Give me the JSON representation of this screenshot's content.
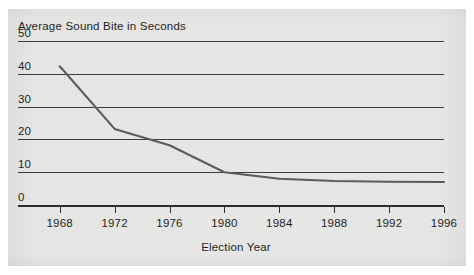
{
  "chart_data": {
    "type": "line",
    "title": "Average Sound Bite in Seconds",
    "xlabel": "Election Year",
    "ylabel": "",
    "x": [
      1968,
      1972,
      1976,
      1980,
      1984,
      1988,
      1992,
      1996
    ],
    "categories": [
      "1968",
      "1972",
      "1976",
      "1980",
      "1984",
      "1988",
      "1992",
      "1996"
    ],
    "values": [
      42.3,
      23.2,
      18.2,
      10.0,
      8.0,
      7.3,
      7.1,
      7.0
    ],
    "series": [
      {
        "name": "Average Sound Bite in Seconds",
        "values": [
          42.3,
          23.2,
          18.2,
          10.0,
          8.0,
          7.3,
          7.1,
          7.0
        ]
      }
    ],
    "xlim": [
      1967,
      1996
    ],
    "ylim": [
      0,
      50
    ],
    "yticks": [
      0,
      10,
      20,
      30,
      40,
      50
    ],
    "ytick_labels": [
      "0",
      "10",
      "20",
      "30",
      "40",
      "50"
    ],
    "xticks": [
      1968,
      1972,
      1976,
      1980,
      1984,
      1988,
      1992,
      1996
    ],
    "xtick_labels": [
      "1968",
      "1972",
      "1976",
      "1980",
      "1984",
      "1988",
      "1992",
      "1996"
    ],
    "grid": true,
    "grid_axis": "y",
    "legend": false,
    "legend_position": "none",
    "line_color": "#5b5b5b",
    "axis_color": "#2b2b2b",
    "grid_color": "#3c3c3c",
    "background_color": "#e7e7e5",
    "page_color": "#ffffff"
  },
  "axis": {
    "y_ticks": [
      {
        "label": "50",
        "value": 50
      },
      {
        "label": "40",
        "value": 40
      },
      {
        "label": "30",
        "value": 30
      },
      {
        "label": "20",
        "value": 20
      },
      {
        "label": "10",
        "value": 10
      },
      {
        "label": "0",
        "value": 0
      }
    ],
    "x_ticks": [
      {
        "label": "1968",
        "value": 1968
      },
      {
        "label": "1972",
        "value": 1972
      },
      {
        "label": "1976",
        "value": 1976
      },
      {
        "label": "1980",
        "value": 1980
      },
      {
        "label": "1984",
        "value": 1984
      },
      {
        "label": "1988",
        "value": 1988
      },
      {
        "label": "1992",
        "value": 1992
      },
      {
        "label": "1996",
        "value": 1996
      }
    ]
  }
}
